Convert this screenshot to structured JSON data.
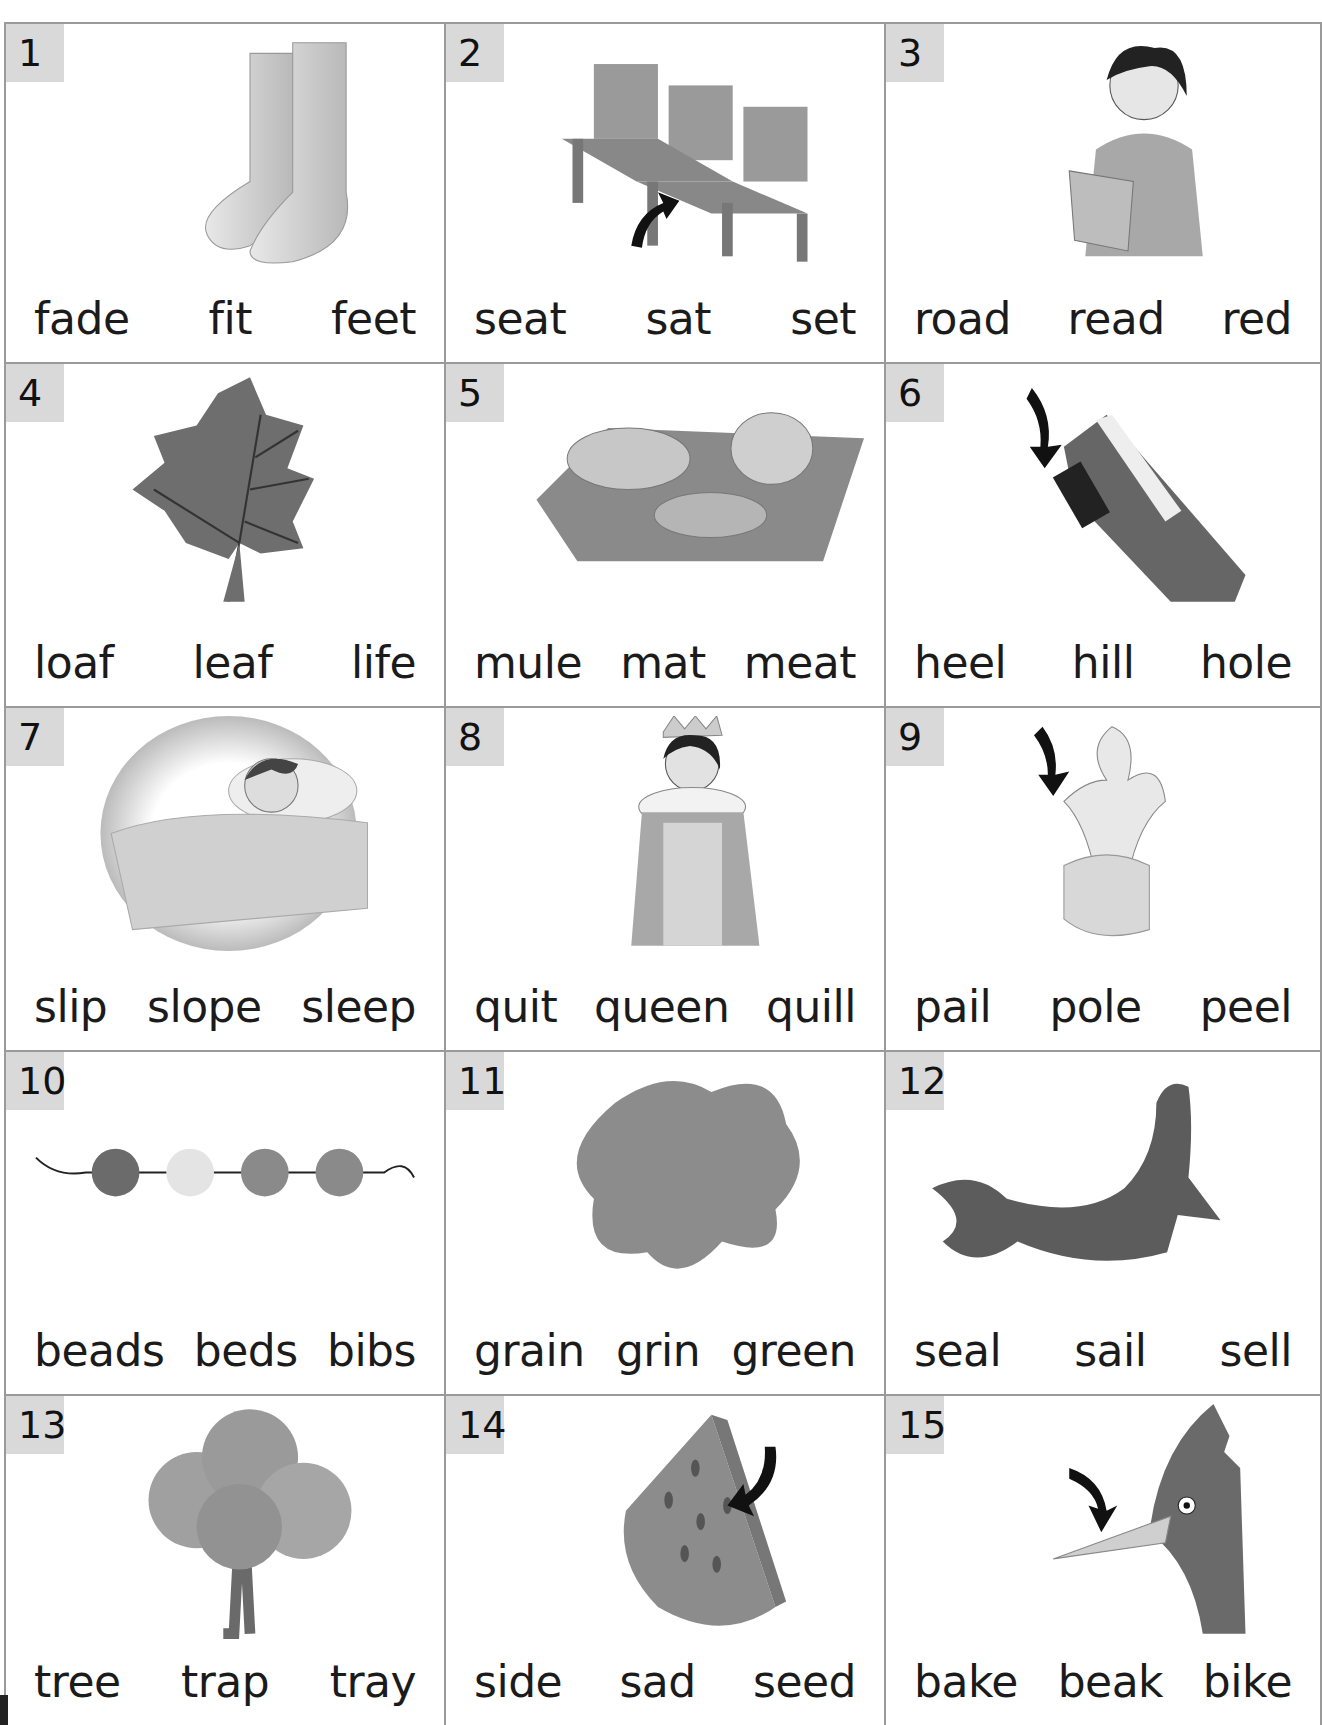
{
  "worksheet": {
    "items": [
      {
        "number": "1",
        "picture": "feet",
        "words": [
          "fade",
          "fit",
          "feet"
        ]
      },
      {
        "number": "2",
        "picture": "seat",
        "words": [
          "seat",
          "sat",
          "set"
        ]
      },
      {
        "number": "3",
        "picture": "girl-reading",
        "words": [
          "road",
          "read",
          "red"
        ]
      },
      {
        "number": "4",
        "picture": "leaf",
        "words": [
          "loaf",
          "leaf",
          "life"
        ]
      },
      {
        "number": "5",
        "picture": "meat",
        "words": [
          "mule",
          "mat",
          "meat"
        ]
      },
      {
        "number": "6",
        "picture": "shoe-heel",
        "words": [
          "heel",
          "hill",
          "hole"
        ]
      },
      {
        "number": "7",
        "picture": "sleeping-girl",
        "words": [
          "slip",
          "slope",
          "sleep"
        ]
      },
      {
        "number": "8",
        "picture": "queen",
        "words": [
          "quit",
          "queen",
          "quill"
        ]
      },
      {
        "number": "9",
        "picture": "banana-peel",
        "words": [
          "pail",
          "pole",
          "peel"
        ]
      },
      {
        "number": "10",
        "picture": "beads",
        "words": [
          "beads",
          "beds",
          "bibs"
        ]
      },
      {
        "number": "11",
        "picture": "green-blob",
        "words": [
          "grain",
          "grin",
          "green"
        ]
      },
      {
        "number": "12",
        "picture": "seal",
        "words": [
          "seal",
          "sail",
          "sell"
        ]
      },
      {
        "number": "13",
        "picture": "tree",
        "words": [
          "tree",
          "trap",
          "tray"
        ]
      },
      {
        "number": "14",
        "picture": "watermelon-seed",
        "words": [
          "side",
          "sad",
          "seed"
        ]
      },
      {
        "number": "15",
        "picture": "bird-beak",
        "words": [
          "bake",
          "beak",
          "bike"
        ]
      }
    ]
  },
  "colors": {
    "grid_line": "#9a9a9a",
    "badge_bg": "#d9d9d9",
    "ink": "#1b1b1b"
  }
}
